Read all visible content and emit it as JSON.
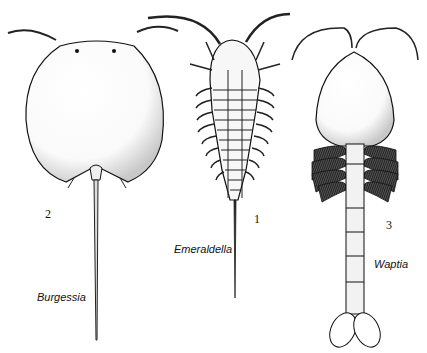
{
  "figure": {
    "specimens": [
      {
        "number": "2",
        "name": "Burgessia"
      },
      {
        "number": "1",
        "name": "Emeraldella"
      },
      {
        "number": "3",
        "name": "Waptia"
      }
    ]
  }
}
